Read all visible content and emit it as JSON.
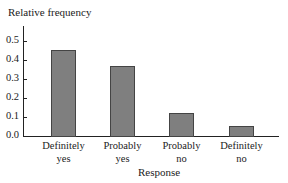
{
  "chart_data": {
    "type": "bar",
    "title": "",
    "xlabel": "Response",
    "ylabel": "Relative frequency",
    "categories": [
      "Definitely yes",
      "Probably yes",
      "Probably no",
      "Definitely no"
    ],
    "category_lines": [
      [
        "Definitely",
        "yes"
      ],
      [
        "Probably",
        "yes"
      ],
      [
        "Probably",
        "no"
      ],
      [
        "Definitely",
        "no"
      ]
    ],
    "values": [
      0.45,
      0.37,
      0.12,
      0.05
    ],
    "yticks": [
      "0.0",
      "0.1",
      "0.2",
      "0.3",
      "0.4",
      "0.5"
    ],
    "ylim": [
      0,
      0.55
    ],
    "grid": false,
    "legend": null,
    "bar_color": "#7f7f7f"
  }
}
